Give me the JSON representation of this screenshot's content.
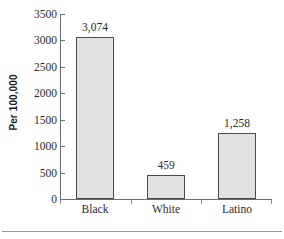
{
  "chart_data": {
    "type": "bar",
    "title": "",
    "subtitle": "",
    "xlabel": "",
    "ylabel": "Per 100,000",
    "categories": [
      "Black",
      "White",
      "Latino"
    ],
    "values": [
      3074,
      459,
      1258
    ],
    "value_labels": [
      "3,074",
      "459",
      "1,258"
    ],
    "ylim": [
      0,
      3500
    ],
    "yticks": [
      0,
      500,
      1000,
      1500,
      2000,
      2500,
      3000,
      3500
    ],
    "ytick_labels": [
      "0",
      "500",
      "1000",
      "1500",
      "2000",
      "2500",
      "3000",
      "3500"
    ],
    "grid": false,
    "legend": null,
    "legend_position": "none",
    "series": [
      {
        "name": "Per 100,000",
        "values": [
          3074,
          459,
          1258
        ]
      }
    ],
    "colors": {
      "bar_fill": "#e2e2e2",
      "bar_border": "#4a4a4a",
      "axis": "#6f6f6f",
      "text": "#2b2b2b",
      "background": "#ffffff",
      "bottom_rule": "#9a9aa2"
    }
  },
  "figure": {
    "y_axis_title": "Per 100,000",
    "bottom_rule_visible": true
  }
}
